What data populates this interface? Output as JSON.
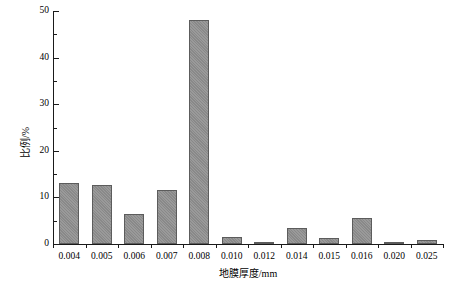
{
  "chart_data": {
    "type": "bar",
    "title": "",
    "subtitle": "",
    "xlabel": "地膜厚度/mm",
    "ylabel": "比例/%",
    "categories": [
      "0.004",
      "0.005",
      "0.006",
      "0.007",
      "0.008",
      "0.010",
      "0.012",
      "0.014",
      "0.015",
      "0.016",
      "0.020",
      "0.025"
    ],
    "values": [
      13.0,
      12.7,
      6.4,
      11.6,
      48.0,
      1.5,
      0.3,
      3.5,
      1.3,
      5.5,
      0.2,
      0.9
    ],
    "ylim": [
      0,
      50
    ],
    "ytick_labels": [
      "0",
      "10",
      "20",
      "30",
      "40",
      "50"
    ],
    "ytick_values": [
      0,
      10,
      20,
      30,
      40,
      50
    ],
    "yminor_values": [
      5,
      15,
      25,
      35,
      45
    ],
    "grid": false,
    "legend": null,
    "legend_position": "none",
    "bar_color": "#8f8f8f",
    "bar_edge_color": "#5c5c5c",
    "axis_color": "#1a1a1a",
    "background_color": "#ffffff",
    "annotations": []
  }
}
